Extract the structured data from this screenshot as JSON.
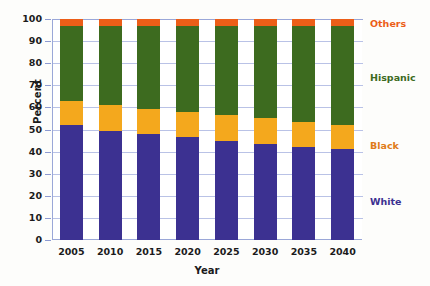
{
  "chart_data": {
    "type": "bar",
    "stacked": true,
    "title": "",
    "xlabel": "Year",
    "ylabel": "Percent",
    "categories": [
      "2005",
      "2010",
      "2015",
      "2020",
      "2025",
      "2030",
      "2035",
      "2040"
    ],
    "series": [
      {
        "name": "White",
        "color": "#3c3191",
        "values": [
          52,
          49.5,
          48,
          46.5,
          45,
          43.5,
          42,
          41
        ]
      },
      {
        "name": "Black",
        "color": "#f4a81d",
        "values": [
          11,
          11.5,
          11.5,
          11.5,
          11.5,
          11.5,
          11.5,
          11
        ]
      },
      {
        "name": "Hispanic",
        "color": "#3d6b1f",
        "values": [
          34,
          36,
          37.5,
          39,
          40.5,
          42,
          43.5,
          45
        ]
      },
      {
        "name": "Others",
        "color": "#ec5e18",
        "values": [
          3,
          3,
          3,
          3,
          3,
          3,
          3,
          3
        ]
      }
    ],
    "ylim": [
      0,
      100
    ],
    "yticks": [
      "0",
      "10",
      "20",
      "30",
      "40",
      "50",
      "60",
      "70",
      "80",
      "90",
      "100"
    ],
    "grid": true,
    "legend_position": "right",
    "legend": [
      {
        "label": "Others",
        "color": "#ec5e18",
        "y": 18
      },
      {
        "label": "Hispanic",
        "color": "#3d6b1f",
        "y": 72
      },
      {
        "label": "Black",
        "color": "#e07b18",
        "y": 140
      },
      {
        "label": "White",
        "color": "#3c3191",
        "y": 196
      }
    ]
  },
  "axes": {
    "grid_color": "#b9c2e6",
    "axis_color": "#9aa7d8",
    "plot_bg": "#ffffff"
  }
}
